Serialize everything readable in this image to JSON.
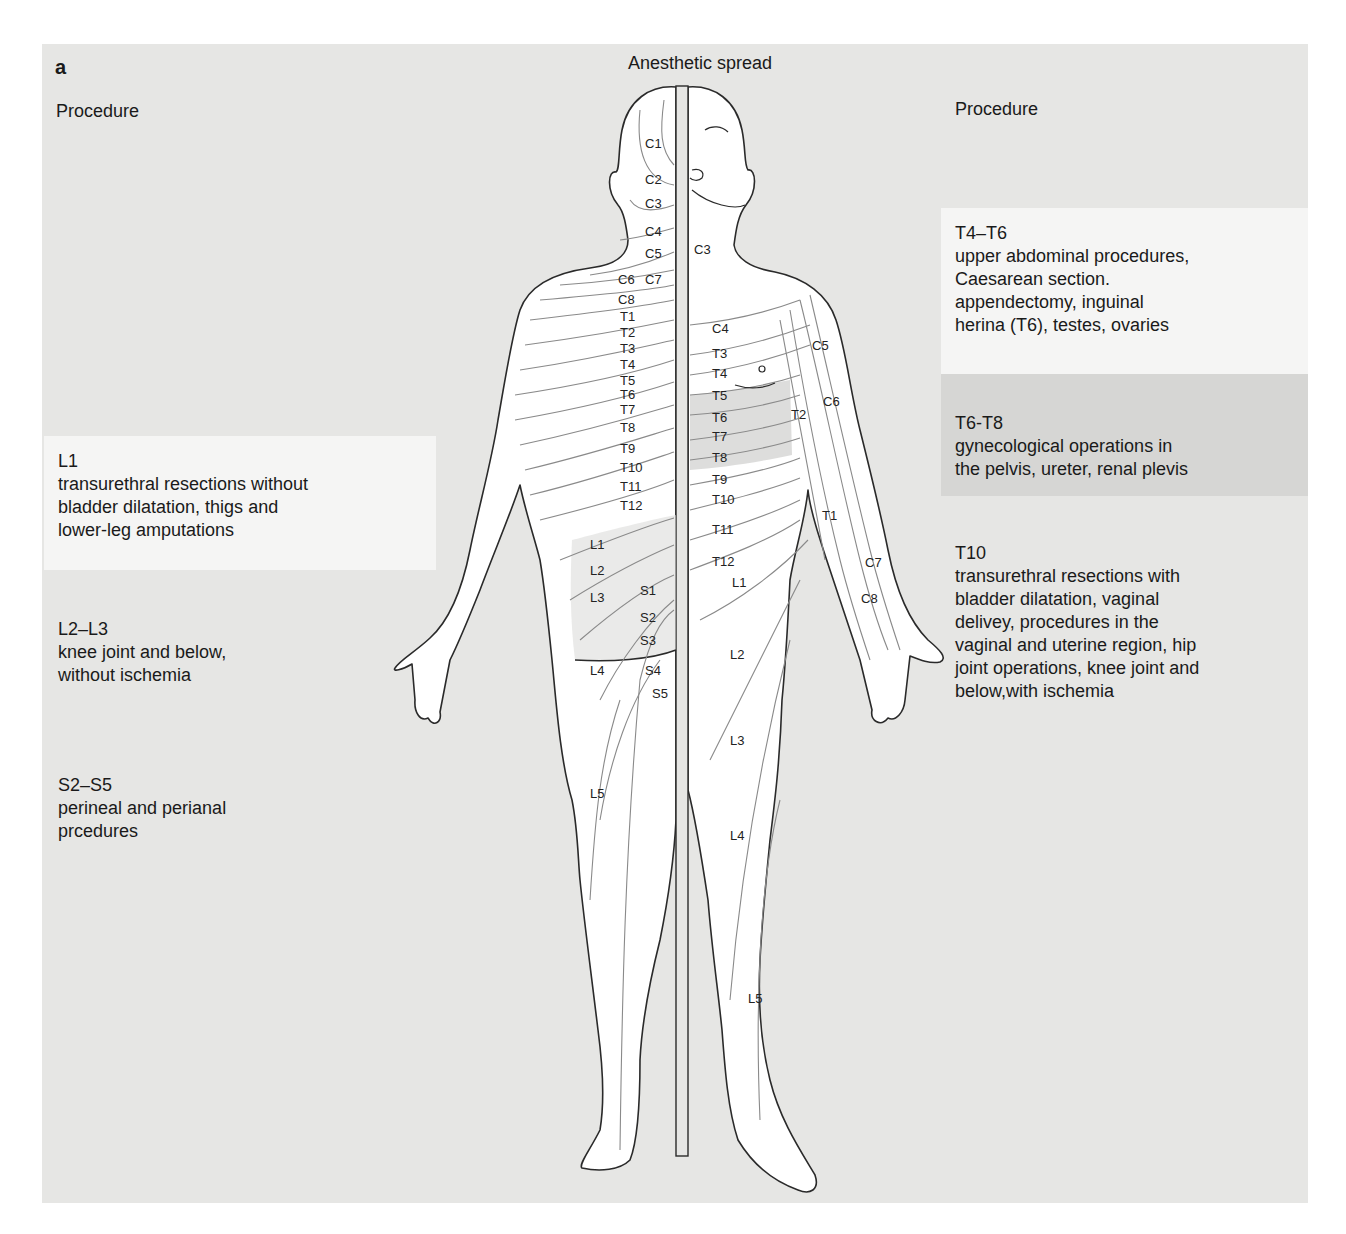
{
  "figure": {
    "panel_letter": "a",
    "title": "Anesthetic spread",
    "left_heading": "Procedure",
    "right_heading": "Procedure",
    "colors": {
      "panel_bg": "#e6e6e4",
      "light_box": "#f5f5f4",
      "dark_box": "#d6d6d4",
      "line": "#2a2a2a",
      "dermatome_line": "#8a8a8a",
      "highlight": "#cfcfcd"
    }
  },
  "left_procedures": [
    {
      "level": "L1",
      "description": "transurethral resections without\nbladder dilatation, thigs and\nlower-leg amputations"
    },
    {
      "level": "L2–L3",
      "description": "knee joint and below,\nwithout ischemia"
    },
    {
      "level": "S2–S5",
      "description": "perineal and perianal\nprcedures"
    }
  ],
  "right_procedures": [
    {
      "level": "T4–T6",
      "description": "upper abdominal procedures,\nCaesarean section.\nappendectomy, inguinal\nherina (T6), testes, ovaries"
    },
    {
      "level": "T6-T8",
      "description": "gynecological operations in\nthe pelvis, ureter, renal plevis"
    },
    {
      "level": "T10",
      "description": "transurethral resections with\nbladder dilatation, vaginal\ndelivey, procedures in the\nvaginal and uterine region, hip\njoint operations, knee joint and\nbelow,with ischemia"
    }
  ],
  "dermatome_labels": {
    "back": [
      "C1",
      "C2",
      "C3",
      "C4",
      "C5",
      "C6",
      "C7",
      "C8",
      "T1",
      "T2",
      "T3",
      "T4",
      "T5",
      "T6",
      "T7",
      "T8",
      "T9",
      "T10",
      "T11",
      "T12",
      "L1",
      "L2",
      "L3",
      "S1",
      "S2",
      "S3",
      "L4",
      "S4",
      "S5",
      "L5"
    ],
    "front": [
      "C3",
      "C4",
      "T3",
      "T4",
      "T5",
      "T6",
      "T7",
      "T8",
      "T9",
      "T10",
      "T11",
      "T12",
      "L1",
      "L2",
      "L3",
      "L4",
      "L5"
    ],
    "arm": [
      "C5",
      "C6",
      "T2",
      "T1",
      "C7",
      "C8"
    ]
  }
}
